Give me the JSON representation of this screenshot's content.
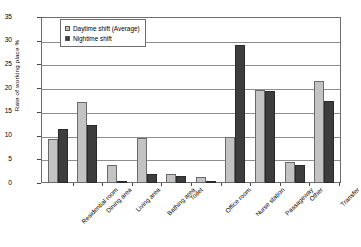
{
  "chart_data": {
    "type": "bar",
    "title": "",
    "xlabel": "",
    "ylabel": "Rate of working place  %",
    "ylim": [
      0,
      35
    ],
    "ytick_values": [
      "35",
      "30",
      "25",
      "20",
      "15",
      "10",
      "5",
      "0"
    ],
    "grid": true,
    "legend_position": "top-left inside plot",
    "categories": [
      "Residential room",
      "Dining area",
      "Living area",
      "Bathing area",
      "Toilet",
      "Office room",
      "Nurse station",
      "Passageway",
      "Other",
      "Transfer"
    ],
    "series": [
      {
        "name": "Daytime shift (Average)",
        "color": "#c3c3c3",
        "values": [
          9.3,
          17.0,
          3.8,
          9.4,
          1.8,
          1.2,
          9.6,
          19.6,
          4.4,
          21.5
        ]
      },
      {
        "name": "Nightime shift",
        "color": "#3d3d3d",
        "values": [
          11.3,
          12.2,
          0.4,
          1.9,
          1.5,
          0.1,
          29.0,
          19.4,
          3.9,
          17.3
        ]
      }
    ]
  },
  "legend": {
    "items": [
      {
        "label": "Daytime shift (Average)"
      },
      {
        "label": "Nightime shift"
      }
    ]
  }
}
